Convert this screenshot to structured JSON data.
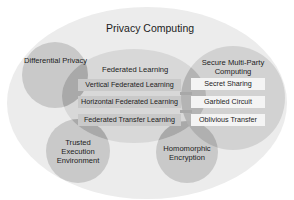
{
  "diagram": {
    "title": "Privacy Computing",
    "outer": {
      "label": "Privacy Computing",
      "color": "#ececec"
    },
    "techniques": [
      {
        "id": "differential-privacy",
        "label": "Differential Privacy",
        "color": "#c8c8c8"
      },
      {
        "id": "trusted-execution-environment",
        "label_lines": [
          "Trusted",
          "Execution",
          "Environment"
        ],
        "color": "#c8c8c8"
      },
      {
        "id": "homomorphic-encryption",
        "label_lines": [
          "Homomorphic",
          "Encryption"
        ],
        "color": "#c8c8c8"
      }
    ],
    "federated_learning": {
      "label": "Federated Learning",
      "color": "#d6d6d6",
      "items": [
        "Vertical Federated Learning",
        "Horizontal Federated Learning",
        "Federated Transfer Learning"
      ]
    },
    "secure_mpc": {
      "label_lines": [
        "Secure Multi-Party",
        "Computing"
      ],
      "color": "#d0d0d0",
      "items": [
        "Secret Sharing",
        "Garbled Circuit",
        "Oblivious Transfer"
      ]
    }
  }
}
